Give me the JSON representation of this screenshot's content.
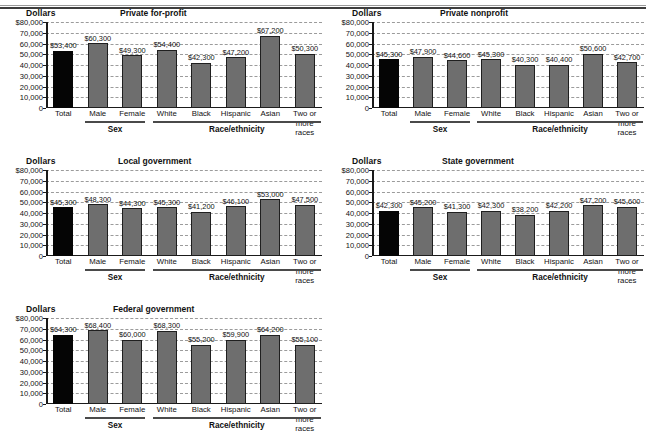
{
  "figure": {
    "axis_unit_label": "Dollars",
    "group_labels": {
      "sex": "Sex",
      "race": "Race/ethnicity"
    }
  },
  "yaxis": {
    "ticks": [
      "$80,000",
      "70,000",
      "60,000",
      "50,000",
      "40,000",
      "30,000",
      "20,000",
      "10,000",
      "0"
    ],
    "min": 0,
    "max": 80000,
    "step": 10000
  },
  "categories": [
    "Total",
    "Male",
    "Female",
    "White",
    "Black",
    "Hispanic",
    "Asian",
    "Two or more races"
  ],
  "chart_data": [
    {
      "type": "bar",
      "title": "Private for-profit",
      "xlabel": "",
      "ylabel": "Dollars",
      "ylim": [
        0,
        80000
      ],
      "grid": true,
      "categories": [
        "Total",
        "Male",
        "Female",
        "White",
        "Black",
        "Hispanic",
        "Asian",
        "Two or more races"
      ],
      "values": [
        53400,
        60300,
        49300,
        54400,
        42300,
        47200,
        67200,
        50300
      ],
      "labels": [
        "$53,400",
        "$60,300",
        "$49,300",
        "$54,400",
        "$42,300",
        "$47,200",
        "$67,200",
        "$50,300"
      ],
      "groups": [
        {
          "label": "Sex",
          "members": [
            "Male",
            "Female"
          ]
        },
        {
          "label": "Race/ethnicity",
          "members": [
            "White",
            "Black",
            "Hispanic",
            "Asian",
            "Two or more races"
          ]
        }
      ]
    },
    {
      "type": "bar",
      "title": "Private nonprofit",
      "xlabel": "",
      "ylabel": "Dollars",
      "ylim": [
        0,
        80000
      ],
      "grid": true,
      "categories": [
        "Total",
        "Male",
        "Female",
        "White",
        "Black",
        "Hispanic",
        "Asian",
        "Two or more races"
      ],
      "values": [
        45300,
        47900,
        44600,
        45300,
        40300,
        40400,
        50600,
        42700
      ],
      "labels": [
        "$45,300",
        "$47,900",
        "$44,600",
        "$45,300",
        "$40,300",
        "$40,400",
        "$50,600",
        "$42,700"
      ],
      "groups": [
        {
          "label": "Sex",
          "members": [
            "Male",
            "Female"
          ]
        },
        {
          "label": "Race/ethnicity",
          "members": [
            "White",
            "Black",
            "Hispanic",
            "Asian",
            "Two or more races"
          ]
        }
      ]
    },
    {
      "type": "bar",
      "title": "Local government",
      "xlabel": "",
      "ylabel": "Dollars",
      "ylim": [
        0,
        80000
      ],
      "grid": true,
      "categories": [
        "Total",
        "Male",
        "Female",
        "White",
        "Black",
        "Hispanic",
        "Asian",
        "Two or more races"
      ],
      "values": [
        45300,
        48300,
        44300,
        45300,
        41200,
        46100,
        53000,
        47500
      ],
      "labels": [
        "$45,300",
        "$48,300",
        "$44,300",
        "$45,300",
        "$41,200",
        "$46,100",
        "$53,000",
        "$47,500"
      ],
      "groups": [
        {
          "label": "Sex",
          "members": [
            "Male",
            "Female"
          ]
        },
        {
          "label": "Race/ethnicity",
          "members": [
            "White",
            "Black",
            "Hispanic",
            "Asian",
            "Two or more races"
          ]
        }
      ]
    },
    {
      "type": "bar",
      "title": "State government",
      "xlabel": "",
      "ylabel": "Dollars",
      "ylim": [
        0,
        80000
      ],
      "grid": true,
      "categories": [
        "Total",
        "Male",
        "Female",
        "White",
        "Black",
        "Hispanic",
        "Asian",
        "Two or more races"
      ],
      "values": [
        42300,
        45200,
        41300,
        42300,
        38200,
        42200,
        47200,
        45600
      ],
      "labels": [
        "$42,300",
        "$45,200",
        "$41,300",
        "$42,300",
        "$38,200",
        "$42,200",
        "$47,200",
        "$45,600"
      ],
      "groups": [
        {
          "label": "Sex",
          "members": [
            "Male",
            "Female"
          ]
        },
        {
          "label": "Race/ethnicity",
          "members": [
            "White",
            "Black",
            "Hispanic",
            "Asian",
            "Two or more races"
          ]
        }
      ]
    },
    {
      "type": "bar",
      "title": "Federal government",
      "xlabel": "",
      "ylabel": "Dollars",
      "ylim": [
        0,
        80000
      ],
      "grid": true,
      "categories": [
        "Total",
        "Male",
        "Female",
        "White",
        "Black",
        "Hispanic",
        "Asian",
        "Two or more races"
      ],
      "values": [
        64300,
        68400,
        60000,
        68300,
        55200,
        59900,
        64200,
        55100
      ],
      "labels": [
        "$64,300",
        "$68,400",
        "$60,000",
        "$68,300",
        "$55,200",
        "$59,900",
        "$64,200",
        "$55,100"
      ],
      "groups": [
        {
          "label": "Sex",
          "members": [
            "Male",
            "Female"
          ]
        },
        {
          "label": "Race/ethnicity",
          "members": [
            "White",
            "Black",
            "Hispanic",
            "Asian",
            "Two or more races"
          ]
        }
      ]
    }
  ],
  "colors": {
    "bar_total": "#050505",
    "bar_group": "#6e6e6e",
    "bar_outline": "#1f1f1f",
    "gridline": "#9b9b9b",
    "axis": "#1a1a1a"
  }
}
